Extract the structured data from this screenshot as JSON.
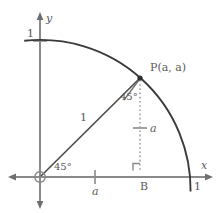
{
  "figure": {
    "name": "unit-circle-quarter-arc-45-degree-diagram",
    "colors": {
      "arc": "#3a3a3a",
      "axis": "#8a8a8a",
      "radius": "#4a4a4a",
      "dotted": "#9a9a9a",
      "text": "#5a5a5a",
      "background": "#ffffff"
    }
  },
  "axes": {
    "x_label": "x",
    "y_label": "y",
    "x_tick_one": "1",
    "y_tick_one": "1",
    "x_tick_a": "a",
    "vertical_tick_a": "a"
  },
  "labels": {
    "point_P": "P(a, a)",
    "radius_length": "1",
    "angle_at_origin": "45°",
    "angle_at_P": "45°",
    "foot_point": "B"
  },
  "geometry": {
    "origin": {
      "x": 40,
      "y": 177
    },
    "point_P": {
      "x": 140,
      "y": 78
    },
    "x_axis_unit": {
      "x": 190,
      "y": 177
    },
    "y_axis_unit": {
      "x": 40,
      "y": 41
    },
    "foot_B": {
      "x": 140,
      "y": 177
    },
    "radius_px": 150,
    "arc_sweep_degrees": 90,
    "angle_of_P_degrees": 45
  }
}
